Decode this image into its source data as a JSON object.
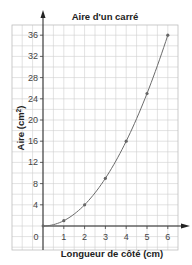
{
  "chart_data": {
    "type": "line",
    "title": "Aire d'un carré",
    "xlabel": "Longueur de côté (cm)",
    "ylabel": "Aire (cm²)",
    "ylabel_base": "Aire (cm",
    "ylabel_sup": "2",
    "ylabel_close": ")",
    "x": [
      1,
      2,
      3,
      4,
      5,
      6
    ],
    "series": [
      {
        "name": "Aire",
        "values": [
          1,
          4,
          9,
          16,
          25,
          36
        ]
      }
    ],
    "curve_start": [
      0.5,
      0.25
    ],
    "origin_label": "0",
    "xticks": [
      "1",
      "2",
      "3",
      "4",
      "5",
      "6"
    ],
    "yticks": [
      "4",
      "8",
      "12",
      "16",
      "20",
      "24",
      "28",
      "32",
      "36"
    ],
    "xlim": [
      0,
      6
    ],
    "ylim": [
      0,
      36
    ],
    "grid": true,
    "legend": "none",
    "colors": {
      "line": "#6b6b6b",
      "grid": "#cfcfcf",
      "axis": "#222222",
      "point": "#666666"
    }
  }
}
